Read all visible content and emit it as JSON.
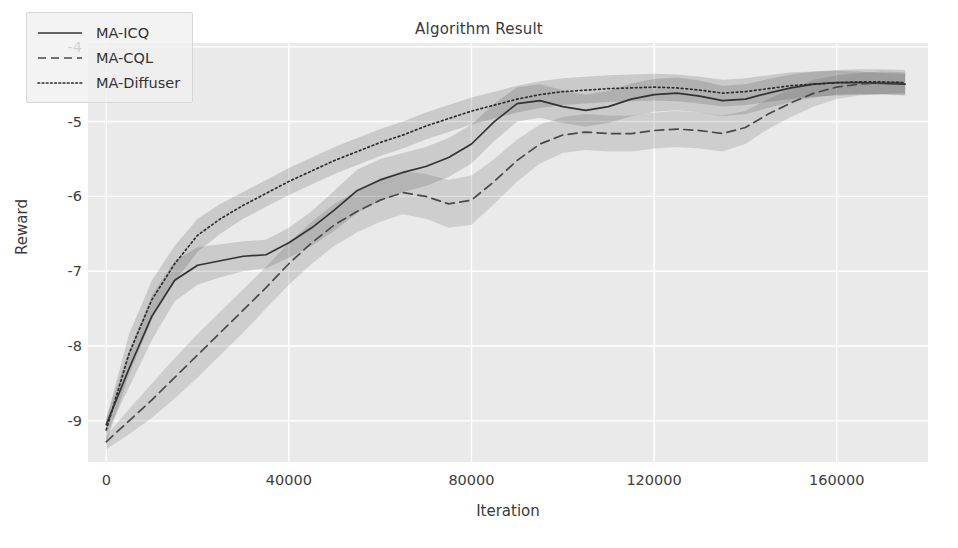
{
  "chart_data": {
    "type": "line",
    "title": "Algorithm Result",
    "xlabel": "Iteration",
    "ylabel": "Reward",
    "xlim": [
      -4000,
      180000
    ],
    "ylim": [
      -9.55,
      -3.95
    ],
    "xticks": [
      0,
      40000,
      80000,
      120000,
      160000
    ],
    "xtick_labels": [
      "0",
      "40000",
      "80000",
      "120000",
      "160000"
    ],
    "yticks": [
      -4,
      -5,
      -6,
      -7,
      -8,
      -9
    ],
    "ytick_labels": [
      "-4",
      "-5",
      "-6",
      "-7",
      "-8",
      "-9"
    ],
    "grid": true,
    "grid_color": "#ffffff",
    "plot_bg": "#eaeaea",
    "legend_position": "upper left",
    "band_type": "confidence interval (shaded)",
    "x": [
      0,
      5000,
      10000,
      15000,
      20000,
      25000,
      30000,
      35000,
      40000,
      45000,
      50000,
      55000,
      60000,
      65000,
      70000,
      75000,
      80000,
      85000,
      90000,
      95000,
      100000,
      105000,
      110000,
      115000,
      120000,
      125000,
      130000,
      135000,
      140000,
      145000,
      150000,
      155000,
      160000,
      165000,
      170000,
      175000
    ],
    "series": [
      {
        "name": "MA-ICQ",
        "style": "solid",
        "color": "#333333",
        "values": [
          -9.05,
          -8.3,
          -7.6,
          -7.12,
          -6.92,
          -6.86,
          -6.8,
          -6.78,
          -6.62,
          -6.42,
          -6.18,
          -5.92,
          -5.78,
          -5.68,
          -5.6,
          -5.48,
          -5.3,
          -5.0,
          -4.76,
          -4.72,
          -4.8,
          -4.85,
          -4.8,
          -4.7,
          -4.64,
          -4.62,
          -4.66,
          -4.72,
          -4.7,
          -4.62,
          -4.55,
          -4.5,
          -4.48,
          -4.48,
          -4.49,
          -4.5
        ],
        "band_low": [
          -9.18,
          -8.55,
          -7.92,
          -7.4,
          -7.18,
          -7.08,
          -7.0,
          -6.96,
          -6.82,
          -6.66,
          -6.46,
          -6.22,
          -6.06,
          -5.94,
          -5.86,
          -5.74,
          -5.56,
          -5.26,
          -5.0,
          -4.95,
          -5.02,
          -5.07,
          -5.02,
          -4.93,
          -4.87,
          -4.85,
          -4.88,
          -4.93,
          -4.9,
          -4.82,
          -4.74,
          -4.68,
          -4.64,
          -4.63,
          -4.63,
          -4.64
        ],
        "band_high": [
          -8.95,
          -8.06,
          -7.32,
          -6.86,
          -6.68,
          -6.64,
          -6.6,
          -6.58,
          -6.42,
          -6.2,
          -5.92,
          -5.64,
          -5.5,
          -5.42,
          -5.34,
          -5.22,
          -5.04,
          -4.76,
          -4.54,
          -4.5,
          -4.58,
          -4.64,
          -4.59,
          -4.49,
          -4.43,
          -4.41,
          -4.45,
          -4.52,
          -4.5,
          -4.43,
          -4.37,
          -4.33,
          -4.32,
          -4.33,
          -4.35,
          -4.36
        ]
      },
      {
        "name": "MA-CQL",
        "style": "dashed",
        "color": "#4a4a4a",
        "values": [
          -9.28,
          -9.0,
          -8.72,
          -8.42,
          -8.12,
          -7.82,
          -7.52,
          -7.22,
          -6.9,
          -6.62,
          -6.38,
          -6.2,
          -6.05,
          -5.95,
          -6.0,
          -6.1,
          -6.05,
          -5.8,
          -5.52,
          -5.3,
          -5.18,
          -5.14,
          -5.16,
          -5.16,
          -5.12,
          -5.1,
          -5.12,
          -5.16,
          -5.08,
          -4.9,
          -4.75,
          -4.62,
          -4.54,
          -4.5,
          -4.48,
          -4.48
        ],
        "band_low": [
          -9.38,
          -9.18,
          -8.96,
          -8.7,
          -8.42,
          -8.12,
          -7.82,
          -7.5,
          -7.18,
          -6.9,
          -6.66,
          -6.48,
          -6.34,
          -6.24,
          -6.3,
          -6.42,
          -6.38,
          -6.1,
          -5.8,
          -5.56,
          -5.42,
          -5.38,
          -5.4,
          -5.4,
          -5.36,
          -5.34,
          -5.36,
          -5.4,
          -5.3,
          -5.1,
          -4.94,
          -4.8,
          -4.7,
          -4.65,
          -4.63,
          -4.62
        ],
        "band_high": [
          -9.2,
          -8.84,
          -8.5,
          -8.16,
          -7.84,
          -7.54,
          -7.24,
          -6.94,
          -6.62,
          -6.34,
          -6.1,
          -5.92,
          -5.76,
          -5.66,
          -5.7,
          -5.78,
          -5.72,
          -5.5,
          -5.24,
          -5.04,
          -4.94,
          -4.9,
          -4.92,
          -4.92,
          -4.88,
          -4.86,
          -4.88,
          -4.92,
          -4.86,
          -4.7,
          -4.56,
          -4.44,
          -4.38,
          -4.35,
          -4.33,
          -4.34
        ]
      },
      {
        "name": "MA-Diffuser",
        "style": "dotted",
        "color": "#2e2e2e",
        "values": [
          -9.12,
          -8.1,
          -7.38,
          -6.9,
          -6.52,
          -6.3,
          -6.12,
          -5.96,
          -5.8,
          -5.66,
          -5.52,
          -5.4,
          -5.28,
          -5.18,
          -5.06,
          -4.96,
          -4.86,
          -4.78,
          -4.7,
          -4.64,
          -4.6,
          -4.58,
          -4.56,
          -4.55,
          -4.54,
          -4.55,
          -4.58,
          -4.62,
          -4.6,
          -4.56,
          -4.52,
          -4.5,
          -4.48,
          -4.47,
          -4.47,
          -4.48
        ],
        "band_low": [
          -9.3,
          -8.38,
          -7.64,
          -7.14,
          -6.74,
          -6.5,
          -6.3,
          -6.14,
          -5.98,
          -5.84,
          -5.7,
          -5.58,
          -5.46,
          -5.36,
          -5.24,
          -5.14,
          -5.04,
          -4.96,
          -4.88,
          -4.82,
          -4.78,
          -4.76,
          -4.74,
          -4.73,
          -4.72,
          -4.73,
          -4.76,
          -4.8,
          -4.78,
          -4.74,
          -4.7,
          -4.67,
          -4.65,
          -4.64,
          -4.64,
          -4.65
        ],
        "band_high": [
          -8.98,
          -7.84,
          -7.12,
          -6.66,
          -6.3,
          -6.1,
          -5.94,
          -5.78,
          -5.62,
          -5.48,
          -5.34,
          -5.22,
          -5.1,
          -5.0,
          -4.88,
          -4.78,
          -4.68,
          -4.6,
          -4.52,
          -4.46,
          -4.42,
          -4.4,
          -4.38,
          -4.37,
          -4.36,
          -4.37,
          -4.4,
          -4.44,
          -4.42,
          -4.38,
          -4.34,
          -4.33,
          -4.31,
          -4.3,
          -4.3,
          -4.31
        ]
      }
    ]
  },
  "legend": {
    "items": [
      {
        "label": "MA-ICQ"
      },
      {
        "label": "MA-CQL"
      },
      {
        "label": "MA-Diffuser"
      }
    ]
  }
}
